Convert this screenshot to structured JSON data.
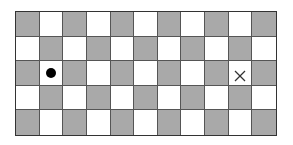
{
  "board": {
    "rows": 5,
    "cols": 11,
    "colors": {
      "dark": "#a9a9a9",
      "light": "#ffffff",
      "line": "#555555"
    },
    "pattern": "checkerboard, top-left cell dark",
    "markers": [
      {
        "type": "dot",
        "label": "start",
        "row": 3,
        "col": 2,
        "color": "#000000"
      },
      {
        "type": "x",
        "label": "goal",
        "row": 3,
        "col": 10,
        "color": "#333333"
      }
    ]
  }
}
